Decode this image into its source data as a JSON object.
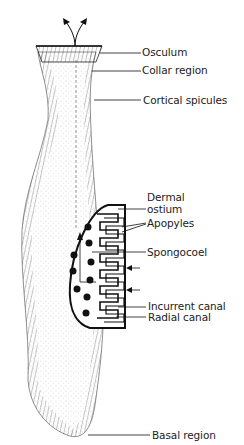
{
  "diagram": {
    "labels": {
      "osculum": "Osculum",
      "collar_region": "Collar region",
      "cortical_spicules": "Cortical spicules",
      "dermal_ostium_line1": "Dermal",
      "dermal_ostium_line2": "ostium",
      "apopyles": "Apopyles",
      "spongocoel": "Spongocoel",
      "incurrent_canal": "Incurrent canal",
      "radial_canal": "Radial canal",
      "basal_region": "Basal region"
    },
    "colors": {
      "ink": "#1a1a1a",
      "background": "#ffffff"
    }
  }
}
